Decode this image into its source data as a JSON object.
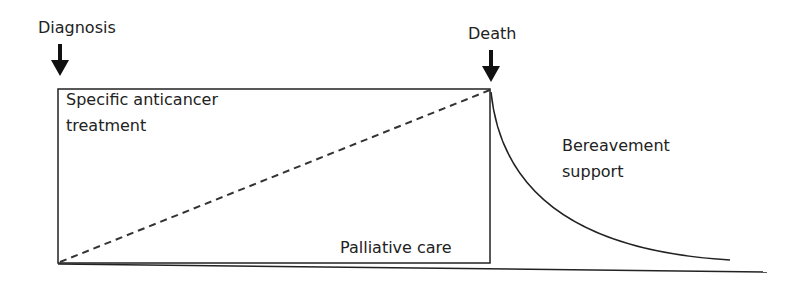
{
  "diagram": {
    "labels": {
      "diagnosis": "Diagnosis",
      "death": "Death",
      "treatment_line1": "Specific anticancer",
      "treatment_line2": "treatment",
      "palliative": "Palliative care",
      "bereavement_line1": "Bereavement",
      "bereavement_line2": "support"
    },
    "colors": {
      "stroke": "#222222",
      "background": "#ffffff"
    }
  }
}
